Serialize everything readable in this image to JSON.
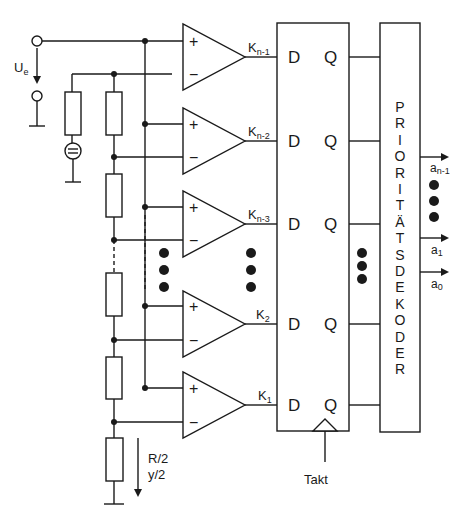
{
  "input": {
    "label": "U",
    "sub": "e"
  },
  "comparators": [
    {
      "label": "K",
      "sub": "n-1",
      "plus": "+",
      "minus": "−"
    },
    {
      "label": "K",
      "sub": "n-2",
      "plus": "+",
      "minus": "−"
    },
    {
      "label": "K",
      "sub": "n-3",
      "plus": "+",
      "minus": "−"
    },
    {
      "label": "K",
      "sub": "2",
      "plus": "+",
      "minus": "−"
    },
    {
      "label": "K",
      "sub": "1",
      "plus": "+",
      "minus": "−"
    }
  ],
  "flipflops": {
    "d_label": "D",
    "q_label": "Q",
    "clock_label": "Takt"
  },
  "decoder": {
    "label_letters": [
      "P",
      "R",
      "I",
      "O",
      "R",
      "I",
      "T",
      "Ä",
      "T",
      "S",
      "D",
      "E",
      "K",
      "O",
      "D",
      "E",
      "R"
    ],
    "label": "PRIORITÄTSDEKODER"
  },
  "outputs": [
    {
      "label": "a",
      "sub": "n-1"
    },
    {
      "label": "a",
      "sub": "1"
    },
    {
      "label": "a",
      "sub": "0"
    }
  ],
  "bottom_resistor": {
    "line1": "R/2",
    "line2": "y/2"
  },
  "colors": {
    "ink": "#1a1a1a",
    "background": "#ffffff"
  }
}
